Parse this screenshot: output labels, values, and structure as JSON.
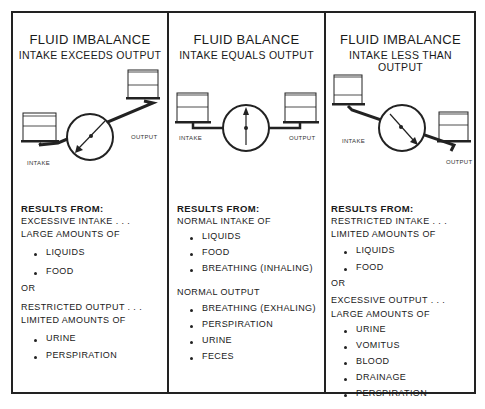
{
  "panels": [
    {
      "title": "FLUID IMBALANCE",
      "subtitle": "INTAKE EXCEEDS OUTPUT",
      "diagram": {
        "intake_label": "INTAKE",
        "output_label": "OUTPUT",
        "state": "intake-heavy"
      },
      "results_heading": "RESULTS FROM:",
      "lines1": [
        "EXCESSIVE INTAKE . . .",
        "LARGE AMOUNTS OF"
      ],
      "bullets1": [
        "LIQUIDS",
        "FOOD"
      ],
      "connector": "OR",
      "lines2": [
        "RESTRICTED OUTPUT . . .",
        "LIMITED AMOUNTS OF"
      ],
      "bullets2": [
        "URINE",
        "PERSPIRATION"
      ]
    },
    {
      "title": "FLUID BALANCE",
      "subtitle": "INTAKE EQUALS OUTPUT",
      "diagram": {
        "intake_label": "INTAKE",
        "output_label": "OUTPUT",
        "state": "balanced"
      },
      "results_heading": "RESULTS FROM:",
      "lines1": [
        "NORMAL INTAKE OF"
      ],
      "bullets1": [
        "LIQUIDS",
        "FOOD",
        "BREATHING (INHALING)"
      ],
      "lines2": [
        "NORMAL OUTPUT"
      ],
      "bullets2": [
        "BREATHING (EXHALING)",
        "PERSPIRATION",
        "URINE",
        "FECES"
      ]
    },
    {
      "title": "FLUID IMBALANCE",
      "subtitle": "INTAKE LESS THAN OUTPUT",
      "diagram": {
        "intake_label": "INTAKE",
        "output_label": "OUTPUT",
        "state": "output-heavy"
      },
      "results_heading": "RESULTS FROM:",
      "lines1": [
        "RESTRICTED INTAKE . . .",
        "LIMITED AMOUNTS OF"
      ],
      "bullets1": [
        "LIQUIDS",
        "FOOD"
      ],
      "connector": "OR",
      "lines2": [
        "EXCESSIVE OUTPUT . . .",
        "LARGE AMOUNTS OF"
      ],
      "bullets2": [
        "URINE",
        "VOMITUS",
        "BLOOD",
        "DRAINAGE",
        "PERSPIRATION"
      ]
    }
  ]
}
